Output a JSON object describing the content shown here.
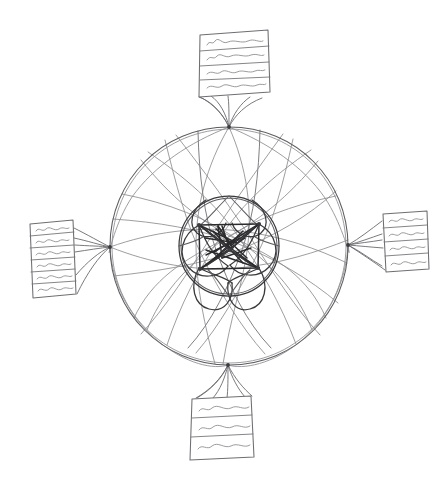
{
  "canvas": {
    "width": 440,
    "height": 487,
    "background_color": "#ffffff",
    "medium": "pencil sketch",
    "title": "Hand-drawn hub-and-spoke network sketch"
  },
  "palette": {
    "paper": "#ffffff",
    "faint_pencil": "#8d8d90",
    "light_pencil": "#78787c",
    "mid_pencil": "#5d5d61",
    "dark_pencil": "#3a3a3d",
    "core_pencil": "#2b2b2e"
  },
  "hub": {
    "label": "central network hub",
    "center": {
      "x": 229,
      "y": 246
    },
    "outer_circle": {
      "radius": 119,
      "stroke": "#5d5d61"
    },
    "inner_circle": {
      "radius": 50,
      "stroke": "#3a3a3d"
    },
    "annulus_chord_count": 22,
    "core_node_count": 5,
    "core_description": "dense star of straight chords with petal arcs"
  },
  "connector_nodes": [
    {
      "name": "north-node",
      "x": 229,
      "y": 127,
      "fan_lines": 5
    },
    {
      "name": "west-node",
      "x": 110,
      "y": 247,
      "fan_lines": 5
    },
    {
      "name": "east-node",
      "x": 348,
      "y": 245,
      "fan_lines": 5
    },
    {
      "name": "south-node",
      "x": 228,
      "y": 365,
      "fan_lines": 5
    }
  ],
  "cards": [
    {
      "name": "card-north",
      "position": "top",
      "x": 198,
      "y": 30,
      "width": 72,
      "height": 68,
      "rows": 4,
      "row_texts": [
        "~~~~~",
        "~~~~~",
        "~~~~~",
        "~~~~~"
      ],
      "content_kind": "handwritten-lines"
    },
    {
      "name": "card-west",
      "position": "left",
      "x": 28,
      "y": 220,
      "width": 46,
      "height": 77,
      "rows": 6,
      "row_texts": [
        "~~~",
        "~~~",
        "~~~",
        "~~~",
        "~~~",
        "~~~"
      ],
      "content_kind": "handwritten-lines"
    },
    {
      "name": "card-east",
      "position": "right",
      "x": 381,
      "y": 212,
      "width": 46,
      "height": 58,
      "rows": 4,
      "row_texts": [
        "~~~",
        "~~~",
        "~~~",
        "~~~"
      ],
      "content_kind": "handwritten-lines"
    },
    {
      "name": "card-south",
      "position": "bottom",
      "x": 188,
      "y": 396,
      "width": 62,
      "height": 60,
      "rows": 3,
      "row_texts": [
        "~~~~",
        "~~~~",
        "~~~~"
      ],
      "content_kind": "handwritten-lines"
    }
  ],
  "accessibility": {
    "alt_text": "Pencil sketch of two concentric circles crossed by many chord lines, with a dense star pattern in the middle, connected by fanned line bundles to four note cards at the top, left, right and bottom."
  }
}
